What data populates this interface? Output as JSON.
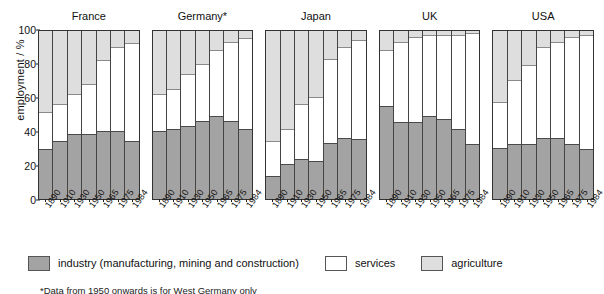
{
  "chart_data": {
    "type": "bar",
    "subtype": "stacked-percent-small-multiples",
    "title": "",
    "xlabel": "",
    "ylabel": "employment / %",
    "ylim": [
      0,
      100
    ],
    "yticks": [
      0,
      20,
      40,
      60,
      80,
      100
    ],
    "grid": false,
    "legend_position": "bottom",
    "categories": [
      "1890",
      "1910",
      "1930",
      "1950",
      "1965",
      "1975",
      "1984"
    ],
    "series_order": [
      "industry",
      "services",
      "agriculture"
    ],
    "legend": [
      {
        "key": "industry",
        "label": "industry (manufacturing, mining and construction)",
        "color": "#a3a3a3"
      },
      {
        "key": "services",
        "label": "services",
        "color": "#ffffff"
      },
      {
        "key": "agriculture",
        "label": "agriculture",
        "color": "#dedede"
      }
    ],
    "panels": [
      {
        "name": "France",
        "industry": [
          29,
          34,
          38,
          38,
          40,
          40,
          34
        ],
        "services": [
          22,
          22,
          24,
          30,
          42,
          50,
          58
        ],
        "agriculture": [
          49,
          44,
          38,
          32,
          18,
          10,
          8
        ]
      },
      {
        "name": "Germany*",
        "industry": [
          40,
          41,
          43,
          46,
          49,
          46,
          41
        ],
        "services": [
          22,
          24,
          31,
          34,
          39,
          47,
          54
        ],
        "agriculture": [
          38,
          35,
          26,
          20,
          12,
          7,
          5
        ]
      },
      {
        "name": "Japan",
        "industry": [
          13,
          20,
          23,
          22,
          33,
          36,
          35
        ],
        "services": [
          21,
          21,
          33,
          38,
          50,
          54,
          59
        ],
        "agriculture": [
          66,
          59,
          44,
          40,
          17,
          10,
          6
        ]
      },
      {
        "name": "UK",
        "industry": [
          55,
          45,
          45,
          49,
          47,
          41,
          32
        ],
        "services": [
          33,
          48,
          51,
          48,
          50,
          56,
          66
        ],
        "agriculture": [
          12,
          7,
          4,
          3,
          3,
          3,
          2
        ]
      },
      {
        "name": "USA",
        "industry": [
          30,
          32,
          32,
          36,
          36,
          32,
          29
        ],
        "services": [
          27,
          38,
          47,
          54,
          57,
          64,
          68
        ],
        "agriculture": [
          43,
          30,
          21,
          10,
          7,
          4,
          3
        ]
      }
    ],
    "footnote": "*Data from 1950 onwards is for West Germany only"
  }
}
